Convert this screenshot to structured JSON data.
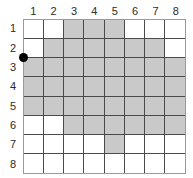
{
  "figure": {
    "grid": {
      "columns": 8,
      "rows": 8,
      "column_headers": [
        "1",
        "2",
        "3",
        "4",
        "5",
        "6",
        "7",
        "8"
      ],
      "row_headers": [
        "1",
        "2",
        "3",
        "4",
        "5",
        "6",
        "7",
        "8"
      ],
      "shaded_color": "#c9c9c9",
      "empty_color": "#ffffff",
      "line_color": "#4a4a4a",
      "border_color": "#9a9a9a",
      "shaded_cells": [
        [
          false,
          false,
          true,
          true,
          true,
          false,
          false,
          false
        ],
        [
          false,
          true,
          true,
          true,
          true,
          true,
          true,
          false
        ],
        [
          true,
          true,
          true,
          true,
          true,
          true,
          true,
          true
        ],
        [
          true,
          true,
          true,
          true,
          true,
          true,
          true,
          true
        ],
        [
          true,
          true,
          true,
          true,
          true,
          true,
          true,
          true
        ],
        [
          false,
          false,
          true,
          true,
          true,
          true,
          true,
          true
        ],
        [
          false,
          false,
          false,
          false,
          true,
          false,
          false,
          false
        ],
        [
          false,
          false,
          false,
          false,
          false,
          false,
          false,
          false
        ]
      ]
    },
    "marker": {
      "label": "start-point",
      "color": "#000000",
      "column": 1,
      "row_boundary": "between row 2 and row 3"
    }
  }
}
